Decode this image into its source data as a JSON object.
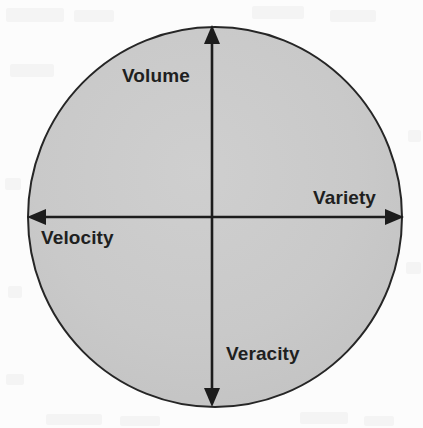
{
  "figure": {
    "type": "quadrant-circle-diagram",
    "background_color": "#fcfcfc",
    "circle": {
      "fill_color": "#c9c9c9",
      "stroke_color": "#262626",
      "center_x": 215,
      "center_y": 217,
      "radius_x": 187,
      "radius_y": 190
    },
    "axes": {
      "stroke_color": "#1c1c1c",
      "vertical": {
        "x": 212,
        "top_y": 26,
        "bottom_y": 406,
        "arrowheads": "both"
      },
      "horizontal": {
        "y": 217,
        "left_x": 28,
        "right_x": 403,
        "arrowheads": "both"
      }
    }
  },
  "labels": {
    "top": "Volume",
    "right": "Variety",
    "left": "Velocity",
    "bottom": "Veracity"
  },
  "chart_data": {
    "type": "diagram",
    "title": "",
    "quadrant_labels": [
      "Volume",
      "Variety",
      "Velocity",
      "Veracity"
    ],
    "axis_endpoint_labels": {
      "up": "Volume",
      "right": "Variety",
      "left": "Velocity",
      "down": "Veracity"
    }
  }
}
